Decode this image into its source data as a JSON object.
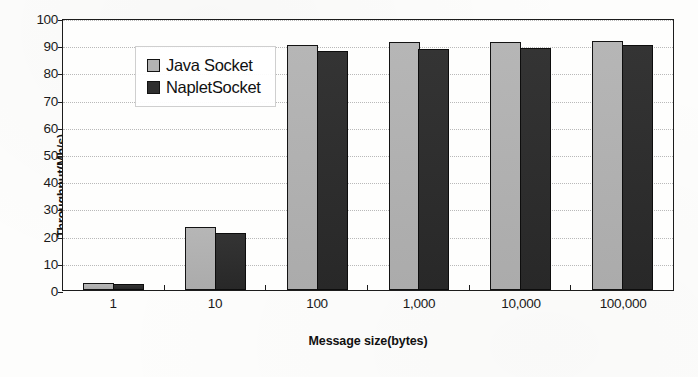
{
  "chart_data": {
    "type": "bar",
    "title": "",
    "xlabel": "Message size(bytes)",
    "ylabel": "Throughput(Mb/s)",
    "categories": [
      "1",
      "10",
      "100",
      "1,000",
      "10,000",
      "100,000"
    ],
    "series": [
      {
        "name": "Java Socket",
        "values": [
          2.5,
          23,
          90,
          91,
          91,
          91.5
        ],
        "color": "#b2b2b2"
      },
      {
        "name": "NapletSocket",
        "values": [
          2.3,
          21,
          88,
          88.5,
          89,
          90
        ],
        "color": "#2f2f2f"
      }
    ],
    "ylim": [
      0,
      100
    ],
    "yticks": [
      "100",
      "90",
      "80",
      "70",
      "60",
      "50",
      "40",
      "30",
      "20",
      "10",
      "0"
    ],
    "grid": true,
    "legend_position": "top-left-inside"
  }
}
